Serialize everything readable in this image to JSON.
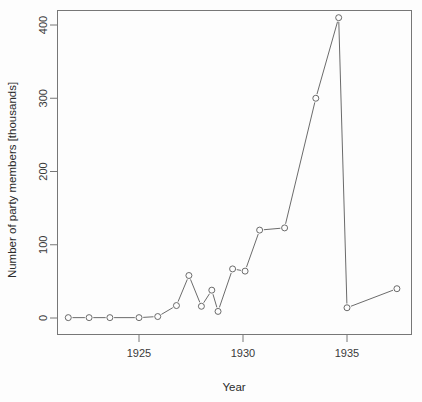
{
  "chart_data": {
    "type": "line",
    "title": "",
    "xlabel": "Year",
    "ylabel": "Number of party members [thousands]",
    "xlim": [
      1921.0,
      1938.2
    ],
    "ylim": [
      -12,
      425
    ],
    "xticks": [
      1925,
      1930,
      1935
    ],
    "xticklabels": [
      "1925",
      "1930",
      "1935"
    ],
    "yticks": [
      0,
      100,
      200,
      300,
      400
    ],
    "yticklabels": [
      "0",
      "100",
      "200",
      "300",
      "400"
    ],
    "grid": false,
    "legend": null,
    "marker": "open-circle",
    "line_style": "solid",
    "color": "#5a5a5a",
    "x": [
      1921.6,
      1922.6,
      1923.6,
      1925.0,
      1925.9,
      1926.8,
      1927.4,
      1928.0,
      1928.5,
      1928.8,
      1929.5,
      1930.1,
      1930.8,
      1932.0,
      1933.5,
      1934.6,
      1935.0,
      1937.4
    ],
    "values": [
      0.5,
      0.5,
      0.5,
      0.5,
      2,
      17,
      58,
      16,
      38,
      9,
      67,
      64,
      120,
      123,
      300,
      410,
      14,
      40
    ],
    "series": [
      {
        "name": "party members",
        "points": [
          {
            "x": 1921.6,
            "y": 0.5
          },
          {
            "x": 1922.6,
            "y": 0.5
          },
          {
            "x": 1923.6,
            "y": 0.5
          },
          {
            "x": 1925.0,
            "y": 0.5
          },
          {
            "x": 1925.9,
            "y": 2
          },
          {
            "x": 1926.8,
            "y": 17
          },
          {
            "x": 1927.4,
            "y": 58
          },
          {
            "x": 1928.0,
            "y": 16
          },
          {
            "x": 1928.5,
            "y": 38
          },
          {
            "x": 1928.8,
            "y": 9
          },
          {
            "x": 1929.5,
            "y": 67
          },
          {
            "x": 1930.1,
            "y": 64
          },
          {
            "x": 1930.8,
            "y": 120
          },
          {
            "x": 1932.0,
            "y": 123
          },
          {
            "x": 1933.5,
            "y": 300
          },
          {
            "x": 1934.6,
            "y": 410
          },
          {
            "x": 1935.0,
            "y": 14
          },
          {
            "x": 1937.4,
            "y": 40
          }
        ]
      }
    ]
  }
}
